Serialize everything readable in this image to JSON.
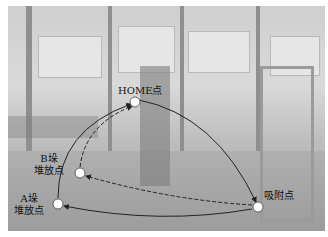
{
  "points": {
    "home": {
      "label": "HOME点",
      "x": 135,
      "y": 102
    },
    "b_stack": {
      "label_line1": "B垛",
      "label_line2": "堆放点",
      "x": 80,
      "y": 173
    },
    "a_stack": {
      "label_line1": "A垛",
      "label_line2": "堆放点",
      "x": 58,
      "y": 204
    },
    "suction": {
      "label": "吸附点",
      "x": 258,
      "y": 207
    }
  },
  "colors": {
    "path": "#222222",
    "point_fill": "#ffffff",
    "point_stroke": "#444444"
  }
}
